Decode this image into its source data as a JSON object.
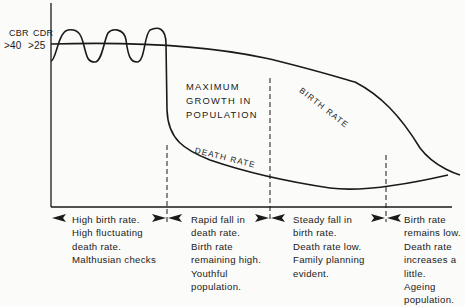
{
  "diagram": {
    "type": "demographic-transition-model",
    "y_axis": {
      "cbr_label": "CBR",
      "cdr_label": "CDR",
      "cbr_value": ">40",
      "cdr_value": ">25"
    },
    "annotation": {
      "line1": "MAXIMUM",
      "line2": "GROWTH IN",
      "line3": "POPULATION"
    },
    "curves": {
      "birth_rate_label": "BIRTH RATE",
      "death_rate_label": "DEATH   RATE"
    },
    "stages": [
      {
        "lines": [
          "High birth rate.",
          "High fluctuating",
          "death rate.",
          "Malthusian checks"
        ]
      },
      {
        "lines": [
          "Rapid fall in",
          "death rate.",
          "Birth rate",
          "remaining high.",
          "Youthful",
          "population."
        ]
      },
      {
        "lines": [
          "Steady fall in",
          "birth rate.",
          "Death rate low.",
          "Family planning",
          "evident."
        ]
      },
      {
        "lines": [
          "Birth rate",
          "remains low.",
          "Death rate",
          "increases a",
          "little.",
          "Ageing",
          "population."
        ]
      }
    ],
    "colors": {
      "ink": "#1a1a1a",
      "background": "#fbfbf9"
    }
  }
}
